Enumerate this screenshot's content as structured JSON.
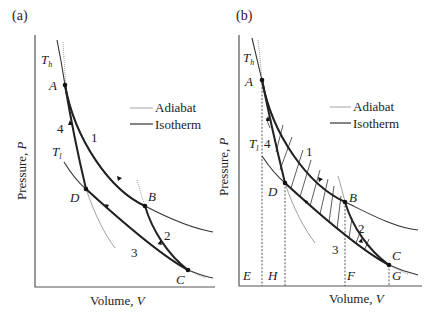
{
  "panels": [
    {
      "id": "a",
      "tag": "(a)",
      "xlabel": "Volume, ",
      "xlabel_var": "V",
      "ylabel": "Pressure, ",
      "ylabel_var": "P",
      "isotherm_hot_label": "T",
      "isotherm_hot_sub": "h",
      "isotherm_cold_label": "T",
      "isotherm_cold_sub": "l",
      "points": [
        "A",
        "B",
        "C",
        "D"
      ],
      "process_labels": [
        "1",
        "2",
        "3",
        "4"
      ],
      "legend": [
        {
          "label": "Adiabat",
          "style": "thin-gray"
        },
        {
          "label": "Isotherm",
          "style": "dark"
        }
      ]
    },
    {
      "id": "b",
      "tag": "(b)",
      "xlabel": "Volume, ",
      "xlabel_var": "V",
      "ylabel": "Pressure, ",
      "ylabel_var": "P",
      "isotherm_hot_label": "T",
      "isotherm_hot_sub": "h",
      "isotherm_cold_label": "T",
      "isotherm_cold_sub": "l",
      "points": [
        "A",
        "B",
        "C",
        "D"
      ],
      "process_labels": [
        "1",
        "2",
        "3",
        "4"
      ],
      "volume_markers": [
        "E",
        "H",
        "F",
        "G"
      ],
      "legend": [
        {
          "label": "Adiabat",
          "style": "thin-gray"
        },
        {
          "label": "Isotherm",
          "style": "dark"
        }
      ]
    }
  ],
  "colors": {
    "curve": "#222222",
    "adiabat": "#888888",
    "axis": "#555555"
  }
}
